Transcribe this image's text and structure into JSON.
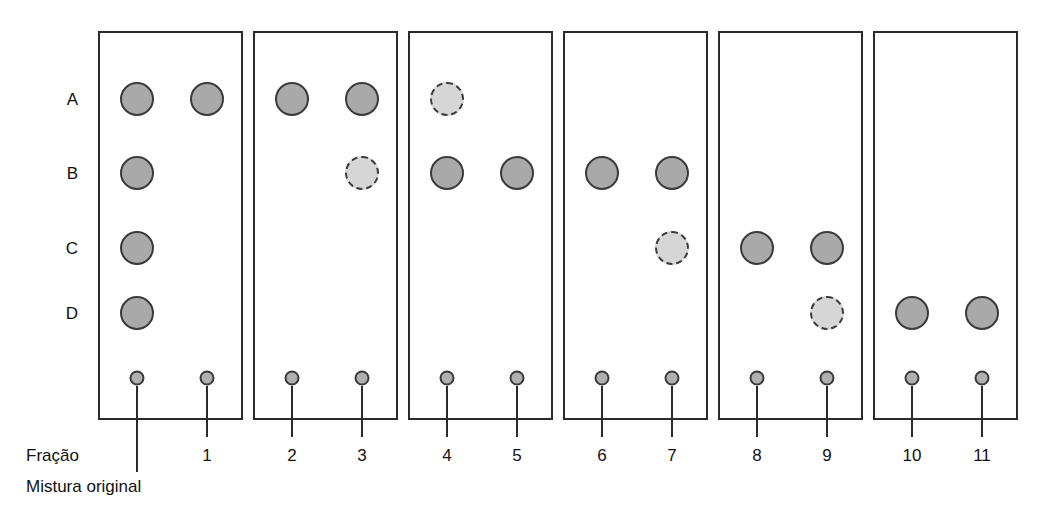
{
  "figure": {
    "title_text": "",
    "background_color": "#ffffff",
    "spot_fill_solid": "#a9a9a9",
    "spot_fill_dashed": "#d6d6d6",
    "spot_outline_color": "#3a3a3a",
    "panel_border_color": "#2b2b2b"
  },
  "row_labels": [
    {
      "label": "A"
    },
    {
      "label": "B"
    },
    {
      "label": "C"
    },
    {
      "label": "D"
    }
  ],
  "lane_numbers": [
    {
      "label": "1"
    },
    {
      "label": "2"
    },
    {
      "label": "3"
    },
    {
      "label": "4"
    },
    {
      "label": "5"
    },
    {
      "label": "6"
    },
    {
      "label": "7"
    },
    {
      "label": "8"
    },
    {
      "label": "9"
    },
    {
      "label": "10"
    },
    {
      "label": "11"
    }
  ],
  "captions": {
    "fraction_label": "Fração",
    "original_mixture_label": "Mistura original"
  },
  "chart_data": {
    "type": "table",
    "xlabel": "Fração",
    "ylabel": "",
    "grid": false,
    "legend": "",
    "row_labels": [
      "A",
      "B",
      "C",
      "D"
    ],
    "lane_labels": [
      "Mistura original",
      "1",
      "2",
      "3",
      "4",
      "5",
      "6",
      "7",
      "8",
      "9",
      "10",
      "11"
    ],
    "spot_styles": [
      "solid",
      "dashed",
      "none"
    ],
    "panels": [
      {
        "panel_index": 1,
        "lanes": [
          {
            "lane": "Mistura original",
            "spots": [
              {
                "row": "A",
                "style": "solid"
              },
              {
                "row": "B",
                "style": "solid"
              },
              {
                "row": "C",
                "style": "solid"
              },
              {
                "row": "D",
                "style": "solid"
              }
            ]
          },
          {
            "lane": "1",
            "spots": [
              {
                "row": "A",
                "style": "solid"
              }
            ]
          }
        ]
      },
      {
        "panel_index": 2,
        "lanes": [
          {
            "lane": "2",
            "spots": [
              {
                "row": "A",
                "style": "solid"
              }
            ]
          },
          {
            "lane": "3",
            "spots": [
              {
                "row": "A",
                "style": "solid"
              },
              {
                "row": "B",
                "style": "dashed"
              }
            ]
          }
        ]
      },
      {
        "panel_index": 3,
        "lanes": [
          {
            "lane": "4",
            "spots": [
              {
                "row": "A",
                "style": "dashed"
              },
              {
                "row": "B",
                "style": "solid"
              }
            ]
          },
          {
            "lane": "5",
            "spots": [
              {
                "row": "B",
                "style": "solid"
              }
            ]
          }
        ]
      },
      {
        "panel_index": 4,
        "lanes": [
          {
            "lane": "6",
            "spots": [
              {
                "row": "B",
                "style": "solid"
              }
            ]
          },
          {
            "lane": "7",
            "spots": [
              {
                "row": "B",
                "style": "solid"
              },
              {
                "row": "C",
                "style": "dashed"
              }
            ]
          }
        ]
      },
      {
        "panel_index": 5,
        "lanes": [
          {
            "lane": "8",
            "spots": [
              {
                "row": "C",
                "style": "solid"
              }
            ]
          },
          {
            "lane": "9",
            "spots": [
              {
                "row": "C",
                "style": "solid"
              },
              {
                "row": "D",
                "style": "dashed"
              }
            ]
          }
        ]
      },
      {
        "panel_index": 6,
        "lanes": [
          {
            "lane": "10",
            "spots": [
              {
                "row": "D",
                "style": "solid"
              }
            ]
          },
          {
            "lane": "11",
            "spots": [
              {
                "row": "D",
                "style": "solid"
              }
            ]
          }
        ]
      }
    ]
  },
  "layout": {
    "panel_top": 31,
    "panel_bottom": 420,
    "panel_width": 145,
    "panel_pitch": 155,
    "panel_first_left": 98,
    "lane_offsets": [
      39,
      109
    ],
    "row_y": {
      "A": 99,
      "B": 173,
      "C": 248,
      "D": 313
    },
    "origin_y": 378,
    "spot_diameter": 34,
    "origin_diameter": 15,
    "number_y": 447,
    "leader_bottom": 437
  }
}
